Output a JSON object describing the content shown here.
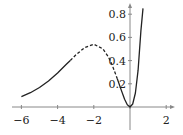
{
  "chart_data": {
    "type": "line",
    "title": "",
    "xlabel": "",
    "ylabel": "",
    "xlim": [
      -6.5,
      2.4
    ],
    "ylim": [
      0,
      0.85
    ],
    "grid": false,
    "legend": null,
    "x_ticks": [
      -6,
      -4,
      -2,
      0,
      2
    ],
    "x_tick_labels": [
      "−6",
      "−4",
      "−2",
      "",
      "2"
    ],
    "y_ticks": [
      0.2,
      0.4,
      0.6,
      0.8
    ],
    "y_tick_labels": [
      "0.2",
      "0.4",
      "0.6",
      "0.8"
    ],
    "function_hint": "x^2 e^x",
    "series": [
      {
        "name": "left-solid",
        "style": "solid",
        "x": [
          -6,
          -5.5,
          -5,
          -4.5,
          -4,
          -3.5,
          -3.3
        ],
        "y": [
          0.089,
          0.123,
          0.168,
          0.225,
          0.293,
          0.371,
          0.401
        ]
      },
      {
        "name": "middle-dashed",
        "style": "dashed",
        "x": [
          -3.3,
          -3,
          -2.5,
          -2,
          -1.5,
          -1.2,
          -1,
          -0.7
        ],
        "y": [
          0.401,
          0.448,
          0.513,
          0.541,
          0.502,
          0.434,
          0.368,
          0.243
        ]
      },
      {
        "name": "right-solid",
        "style": "solid",
        "x": [
          -0.7,
          -0.5,
          -0.3,
          -0.15,
          0,
          0.15,
          0.3,
          0.45,
          0.6,
          0.72
        ],
        "y": [
          0.243,
          0.152,
          0.067,
          0.019,
          0,
          0.026,
          0.121,
          0.317,
          0.656,
          0.85
        ]
      }
    ]
  }
}
